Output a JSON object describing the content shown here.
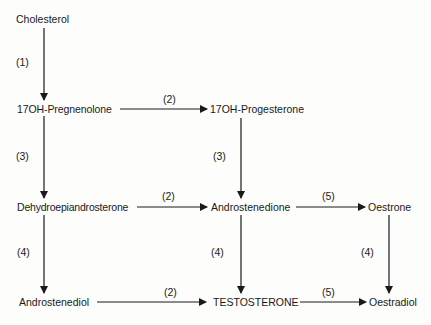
{
  "diagram": {
    "title": "",
    "nodes": {
      "cholesterol": "Cholesterol",
      "oh_pregnenolone": "17OH-Pregnenolone",
      "oh_progesterone": "17OH-Progesterone",
      "dhea": "Dehydroepiandrosterone",
      "androstenedione": "Androstenedione",
      "oestrone": "Oestrone",
      "androstenediol": "Androstenediol",
      "testosterone": "TESTOSTERONE",
      "oestradiol": "Oestradiol"
    },
    "edges": [
      {
        "from": "Cholesterol",
        "to": "17OH-Pregnenolone",
        "label": "(1)"
      },
      {
        "from": "17OH-Pregnenolone",
        "to": "17OH-Progesterone",
        "label": "(2)"
      },
      {
        "from": "17OH-Pregnenolone",
        "to": "Dehydroepiandrosterone",
        "label": "(3)"
      },
      {
        "from": "17OH-Progesterone",
        "to": "Androstenedione",
        "label": "(3)"
      },
      {
        "from": "Dehydroepiandrosterone",
        "to": "Androstenedione",
        "label": "(2)"
      },
      {
        "from": "Androstenedione",
        "to": "Oestrone",
        "label": "(5)"
      },
      {
        "from": "Dehydroepiandrosterone",
        "to": "Androstenediol",
        "label": "(4)"
      },
      {
        "from": "Androstenedione",
        "to": "TESTOSTERONE",
        "label": "(4)"
      },
      {
        "from": "Oestrone",
        "to": "Oestradiol",
        "label": "(4)"
      },
      {
        "from": "Androstenediol",
        "to": "TESTOSTERONE",
        "label": "(2)"
      },
      {
        "from": "TESTOSTERONE",
        "to": "Oestradiol",
        "label": "(5)"
      }
    ],
    "edge_labels": {
      "e1": "(1)",
      "e2_top": "(2)",
      "e3_left": "(3)",
      "e3_mid": "(3)",
      "e2_mid": "(2)",
      "e5_mid": "(5)",
      "e4_left": "(4)",
      "e4_mid": "(4)",
      "e4_right": "(4)",
      "e2_bottom": "(2)",
      "e5_bottom": "(5)"
    },
    "colors": {
      "ink": "#1a1a1a",
      "background": "#fdfdfc"
    }
  }
}
